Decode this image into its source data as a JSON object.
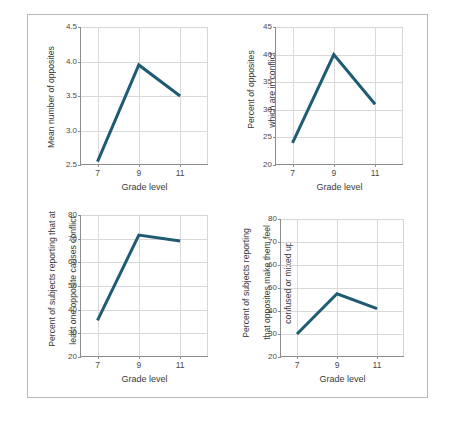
{
  "figure": {
    "border_color": "#b9b9b9",
    "background": "#ffffff",
    "line_color": "#1f5b73"
  },
  "chart_data": [
    {
      "id": "panel-1",
      "type": "line",
      "title": "",
      "xlabel": "Grade level",
      "ylabel": "Mean number of opposites",
      "ylabel_lines": [
        "Mean number of opposites"
      ],
      "categories": [
        "7",
        "9",
        "11"
      ],
      "x": [
        7,
        9,
        11
      ],
      "values": [
        2.55,
        3.95,
        3.5
      ],
      "xticks": [
        "7",
        "9",
        "11"
      ],
      "yticks": [
        "2.5",
        "3.0",
        "3.5",
        "4.0",
        "4.5"
      ],
      "ylim": [
        2.5,
        4.5
      ],
      "xlim": [
        6.2,
        12.4
      ],
      "grid": true,
      "legend": "none"
    },
    {
      "id": "panel-2",
      "type": "line",
      "title": "",
      "xlabel": "Grade level",
      "ylabel": "Percent of opposites which are in conflict",
      "ylabel_lines": [
        "Percent of opposites",
        "which are in conflict"
      ],
      "categories": [
        "7",
        "9",
        "11"
      ],
      "x": [
        7,
        9,
        11
      ],
      "values": [
        24,
        40,
        31
      ],
      "xticks": [
        "7",
        "9",
        "11"
      ],
      "yticks": [
        "20",
        "25",
        "30",
        "35",
        "40",
        "45"
      ],
      "ylim": [
        20,
        45
      ],
      "xlim": [
        6.2,
        12.4
      ],
      "grid": true,
      "legend": "none"
    },
    {
      "id": "panel-3",
      "type": "line",
      "title": "",
      "xlabel": "Grade level",
      "ylabel": "Percent of subjects reporting that at least one opposite causes conflict",
      "ylabel_lines": [
        "Percent of subjects reporting that at",
        "least one opposite causes conflict"
      ],
      "categories": [
        "7",
        "9",
        "11"
      ],
      "x": [
        7,
        9,
        11
      ],
      "values": [
        35.5,
        71.5,
        69
      ],
      "xticks": [
        "7",
        "9",
        "11"
      ],
      "yticks": [
        "20",
        "30",
        "40",
        "50",
        "60",
        "70",
        "80"
      ],
      "ylim": [
        20,
        80
      ],
      "xlim": [
        6.2,
        12.4
      ],
      "grid": true,
      "legend": "none"
    },
    {
      "id": "panel-4",
      "type": "line",
      "title": "",
      "xlabel": "Grade level",
      "ylabel": "Percent of subjects reporting that opposites make them feel confused or mixed up",
      "ylabel_lines": [
        "Percent of subjects reporting",
        "that opposites make them feel",
        "confused or mixed up"
      ],
      "categories": [
        "7",
        "9",
        "11"
      ],
      "x": [
        7,
        9,
        11
      ],
      "values": [
        30,
        47.5,
        41
      ],
      "xticks": [
        "7",
        "9",
        "11"
      ],
      "yticks": [
        "20",
        "30",
        "40",
        "50",
        "60",
        "70",
        "80"
      ],
      "ylim": [
        20,
        80
      ],
      "xlim": [
        6.2,
        12.4
      ],
      "grid": true,
      "legend": "none"
    }
  ]
}
